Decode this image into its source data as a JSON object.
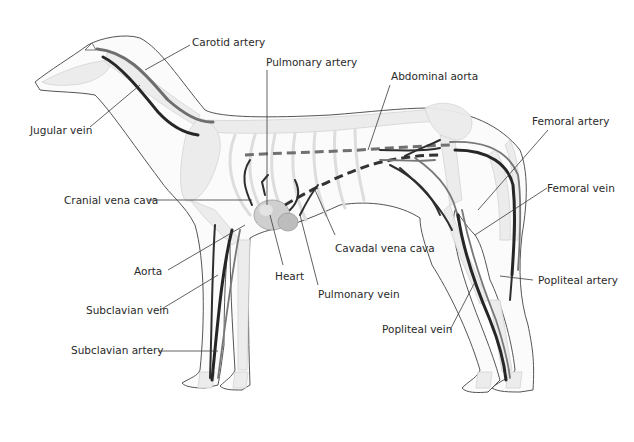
{
  "diagram": {
    "colors": {
      "background": "#ffffff",
      "outline": "#555555",
      "artery": "#6e6e6e",
      "vein": "#262626",
      "bone": "#ececec",
      "label_text": "#2a2a2a"
    },
    "labels": {
      "carotid_artery": "Carotid artery",
      "pulmonary_artery": "Pulmonary artery",
      "abdominal_aorta": "Abdominal aorta",
      "jugular_vein": "Jugular vein",
      "femoral_artery": "Femoral artery",
      "cranial_vena_cava": "Cranial vena cava",
      "femoral_vein": "Femoral vein",
      "cavadal_vena_cava": "Cavadal vena cava",
      "aorta": "Aorta",
      "heart": "Heart",
      "popliteal_artery": "Popliteal artery",
      "pulmonary_vein": "Pulmonary vein",
      "subclavian_vein": "Subclavian vein",
      "popliteal_vein": "Popliteal vein",
      "subclavian_artery": "Subclavian artery"
    }
  }
}
